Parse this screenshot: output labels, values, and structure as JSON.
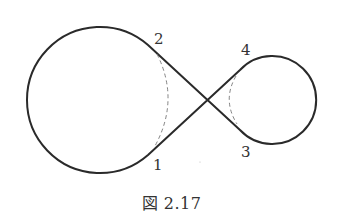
{
  "figure": {
    "caption": "図 2.17",
    "stroke_color": "#2a2a2a",
    "dash_color": "#777777",
    "labels": [
      {
        "id": "1",
        "text": "1",
        "x": 153,
        "y": 170
      },
      {
        "id": "2",
        "text": "2",
        "x": 154,
        "y": 44
      },
      {
        "id": "3",
        "text": "3",
        "x": 241,
        "y": 157
      },
      {
        "id": "4",
        "text": "4",
        "x": 241,
        "y": 55
      }
    ],
    "left_loop": {
      "cx": 100,
      "cy": 100,
      "r": 73
    },
    "right_loop": {
      "cx": 272,
      "cy": 100,
      "r": 44
    },
    "crossing": {
      "x": 207,
      "y": 100
    }
  }
}
